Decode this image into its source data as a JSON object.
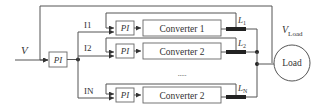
{
  "diagram": {
    "input_label": "V",
    "main_controller": "PI",
    "branches": [
      {
        "current_label": "I1",
        "controller": "PI",
        "converter": "Converter 1",
        "inductor": "L",
        "inductor_sub": "1"
      },
      {
        "current_label": "I2",
        "controller": "PI",
        "converter": "Converter 2",
        "inductor": "L",
        "inductor_sub": "2"
      },
      {
        "current_label": "IN",
        "controller": "PI",
        "converter": "Converter 2",
        "inductor": "L",
        "inductor_sub": "N"
      }
    ],
    "ellipsis": ".....",
    "load_voltage_label": "V",
    "load_voltage_sub": "Load",
    "load_label": "Load"
  }
}
